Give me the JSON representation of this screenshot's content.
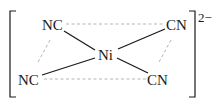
{
  "diagram": {
    "central_atom": "Ni",
    "ligands": [
      {
        "id": "top-left",
        "label": "NC"
      },
      {
        "id": "top-right",
        "label": "CN"
      },
      {
        "id": "bottom-left",
        "label": "NC"
      },
      {
        "id": "bottom-right",
        "label": "CN"
      }
    ],
    "charge": "2−",
    "geometry": "square planar",
    "colors": {
      "text": "#1a1a1a",
      "bond": "#1a1a1a",
      "plane": "#b0b0b0"
    }
  }
}
